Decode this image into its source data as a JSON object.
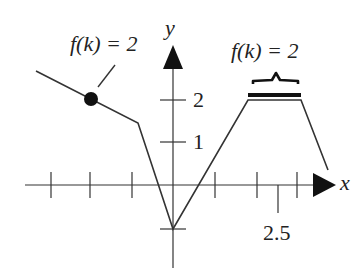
{
  "diagram": {
    "axes": {
      "x_label": "x",
      "y_label": "y",
      "y_tick_labels": [
        "2",
        "1"
      ],
      "x_tick_label": "2.5"
    },
    "annotations": {
      "left": "f(k) = 2",
      "right": "f(k) = 2"
    },
    "colors": {
      "ink": "#222222",
      "background": "#ffffff"
    }
  }
}
